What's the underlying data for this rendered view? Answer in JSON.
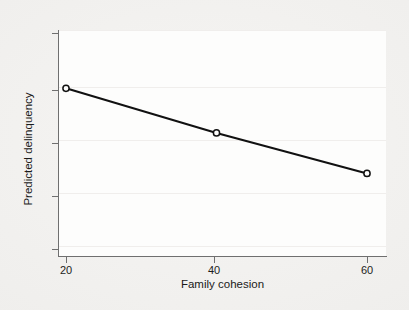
{
  "figure": {
    "background_color": "#f1f0ee",
    "panel_color": "#fdfdfc",
    "axis_color": "#6f6f6f",
    "series_color": "#111111"
  },
  "chart_data": {
    "type": "line",
    "title": "",
    "subtitle": "",
    "xlabel": "Family cohesion",
    "ylabel": "Predicted delinquency",
    "xlim": [
      17,
      62
    ],
    "ylim": [
      0,
      0.84
    ],
    "xticks": [
      20,
      40,
      60
    ],
    "xtick_labels": [
      "20",
      "40",
      "60"
    ],
    "yticks": [
      0,
      0.2,
      0.4,
      0.6,
      0.8
    ],
    "ytick_labels": [
      "0",
      ".2",
      ".4",
      ".6",
      ".8"
    ],
    "grid": "faint-horizontal",
    "legend": "none",
    "marker": "open-circle",
    "x": [
      20,
      40,
      60
    ],
    "y": [
      0.595,
      0.43,
      0.28
    ],
    "series": [
      {
        "name": "Predicted delinquency",
        "points": [
          {
            "x": 20,
            "y": 0.595
          },
          {
            "x": 40,
            "y": 0.43
          },
          {
            "x": 60,
            "y": 0.28
          }
        ]
      }
    ],
    "annotations": []
  }
}
